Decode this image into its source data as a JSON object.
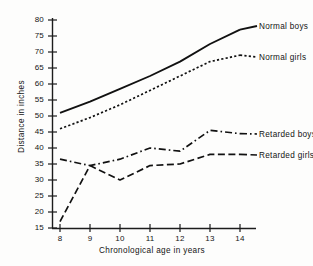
{
  "chart_data": {
    "type": "line",
    "title": "",
    "xlabel": "Chronological age in years",
    "ylabel": "Distance in inches",
    "x": [
      8,
      9,
      10,
      11,
      12,
      13,
      14
    ],
    "categories": [
      "8",
      "9",
      "10",
      "11",
      "12",
      "13",
      "14"
    ],
    "xlim": [
      8,
      14
    ],
    "ylim": [
      15,
      80
    ],
    "ytick_labels": [
      "80",
      "75",
      "70",
      "65",
      "60",
      "55",
      "50",
      "45",
      "40",
      "35",
      "30",
      "25",
      "20",
      "15"
    ],
    "ytick_values": [
      80,
      75,
      70,
      65,
      60,
      55,
      50,
      45,
      40,
      35,
      30,
      25,
      20,
      15
    ],
    "grid": false,
    "legend_position": "right-inline-labels",
    "series": [
      {
        "name": "Normal boys",
        "style": "solid",
        "color": "#111111",
        "values": [
          51,
          54.5,
          58.5,
          62.5,
          67,
          72.5,
          77
        ]
      },
      {
        "name": "Normal girls",
        "style": "dotted",
        "color": "#111111",
        "values": [
          46,
          49.5,
          53.5,
          58,
          62.5,
          67,
          69
        ]
      },
      {
        "name": "Retarded boys",
        "style": "dash-dot",
        "color": "#111111",
        "values": [
          36.5,
          34.5,
          36.5,
          40,
          39,
          45.5,
          44.5
        ]
      },
      {
        "name": "Retarded girls",
        "style": "dashed",
        "color": "#111111",
        "values": [
          17,
          34.5,
          30,
          34.5,
          35,
          38,
          38
        ]
      }
    ]
  },
  "axis": {
    "y_title": "Distance in inches",
    "x_title": "Chronological age in years"
  },
  "labels": {
    "normal_boys": "Normal boys",
    "normal_girls": "Normal girls",
    "retarded_boys": "Retarded boys",
    "retarded_girls": "Retarded girls"
  }
}
